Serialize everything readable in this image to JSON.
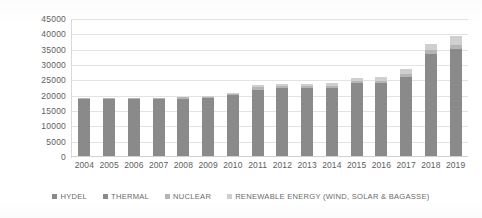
{
  "chart_data": {
    "type": "bar",
    "subtype": "stacked",
    "title": "",
    "xlabel": "",
    "ylabel": "",
    "ylim": [
      0,
      45000
    ],
    "ytick_step": 5000,
    "yticks": [
      "0",
      "5000",
      "10000",
      "15000",
      "20000",
      "25000",
      "30000",
      "35000",
      "40000",
      "45000"
    ],
    "grid": true,
    "legend_position": "bottom",
    "categories": [
      "2004",
      "2005",
      "2006",
      "2007",
      "2008",
      "2009",
      "2010",
      "2011",
      "2012",
      "2013",
      "2014",
      "2015",
      "2016",
      "2017",
      "2018",
      "2019"
    ],
    "series": [
      {
        "name": "HYDEL",
        "color": "#8a8a8a",
        "values": [
          6500,
          6500,
          6500,
          6500,
          6500,
          6500,
          6500,
          6500,
          6600,
          6600,
          6700,
          6800,
          6900,
          7000,
          7100,
          7200
        ]
      },
      {
        "name": "THERMAL",
        "color": "#8a8a8a",
        "values": [
          12300,
          12300,
          12300,
          12400,
          12500,
          12700,
          13700,
          15500,
          15800,
          15800,
          15800,
          17200,
          17300,
          19200,
          26500,
          28000
        ]
      },
      {
        "name": "NUCLEAR",
        "color": "#b5b5b5",
        "values": [
          450,
          450,
          450,
          450,
          450,
          450,
          450,
          750,
          750,
          750,
          750,
          750,
          750,
          750,
          1400,
          1400
        ]
      },
      {
        "name": "RENEWABLE ENERGY (WIND, SOLAR & BAGASSE)",
        "color": "#cfcfcf",
        "values": [
          0,
          0,
          0,
          0,
          0,
          100,
          150,
          600,
          700,
          750,
          900,
          1100,
          1200,
          1700,
          2000,
          2800
        ]
      }
    ],
    "totals": [
      19250,
      19250,
      19250,
      19350,
      19450,
      19750,
      20800,
      23350,
      23850,
      23900,
      24150,
      25850,
      26150,
      28650,
      37000,
      39400
    ],
    "legend": [
      {
        "label": "HYDEL",
        "color": "#8a8a8a"
      },
      {
        "label": "THERMAL",
        "color": "#8a8a8a"
      },
      {
        "label": "NUCLEAR",
        "color": "#b5b5b5"
      },
      {
        "label": "RENEWABLE ENERGY (WIND, SOLAR & BAGASSE)",
        "color": "#cfcfcf"
      }
    ]
  }
}
